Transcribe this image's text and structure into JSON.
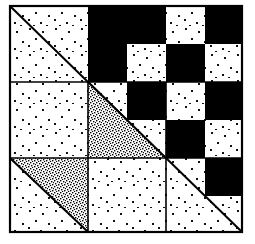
{
  "figure": {
    "canvas": {
      "width": 255,
      "height": 244
    },
    "frame": {
      "x": 9,
      "y": 5,
      "width": 234,
      "height": 228,
      "stroke_color": "#000000",
      "stroke_width": 2
    },
    "grid": {
      "rows": 3,
      "cols": 3,
      "cell_width": 78,
      "cell_height": 76
    },
    "colors": {
      "background": "#ffffff",
      "ink": "#000000",
      "sparse_dot": "#111111",
      "dense_dot": "#000000",
      "solid_black": "#000000"
    },
    "fill_legend": [
      {
        "key": "sparse",
        "label": "sparse dotted"
      },
      {
        "key": "dense",
        "label": "dense stippled"
      },
      {
        "key": "black",
        "label": "solid black"
      },
      {
        "key": "white",
        "label": "plain white"
      }
    ],
    "blocks": [
      {
        "id": "block-r1c1",
        "row": 1,
        "col": 1,
        "name": "top-left-diagonal-block",
        "background": "sparse",
        "diagonal": "tl-br",
        "quadrants": [
          "sparse",
          "black",
          "sparse",
          "sparse"
        ]
      },
      {
        "id": "block-r1c2",
        "row": 1,
        "col": 2,
        "name": "top-middle-checker-block",
        "background": "sparse",
        "diagonal": "none",
        "quadrants": [
          "sparse",
          "black",
          "black",
          "sparse"
        ]
      },
      {
        "id": "block-r1c3",
        "row": 1,
        "col": 3,
        "name": "top-right-checker-block",
        "background": "sparse",
        "diagonal": "none",
        "quadrants": [
          "sparse",
          "black",
          "black",
          "sparse"
        ]
      },
      {
        "id": "block-r2c1",
        "row": 2,
        "col": 1,
        "name": "middle-left-plain-block",
        "background": "sparse",
        "diagonal": "none",
        "quadrants": [
          "sparse",
          "sparse",
          "sparse",
          "sparse"
        ]
      },
      {
        "id": "block-r2c2",
        "row": 2,
        "col": 2,
        "name": "center-stippled-triangle-block",
        "background": "sparse",
        "diagonal": "tl-br",
        "triangle": "lower-left-dense",
        "quadrants": [
          "sparse",
          "black",
          "sparse",
          "sparse"
        ]
      },
      {
        "id": "block-r2c3",
        "row": 2,
        "col": 3,
        "name": "middle-right-checker-block",
        "background": "sparse",
        "diagonal": "none",
        "quadrants": [
          "sparse",
          "black",
          "black",
          "sparse"
        ]
      },
      {
        "id": "block-r3c1",
        "row": 3,
        "col": 1,
        "name": "bottom-left-stippled-triangle-block",
        "background": "sparse",
        "diagonal": "tl-br",
        "triangle": "upper-right-dense",
        "quadrants": [
          "sparse",
          "sparse",
          "sparse",
          "sparse"
        ]
      },
      {
        "id": "block-r3c2",
        "row": 3,
        "col": 2,
        "name": "bottom-middle-plain-block",
        "background": "sparse",
        "diagonal": "none",
        "quadrants": [
          "sparse",
          "sparse",
          "sparse",
          "sparse"
        ]
      },
      {
        "id": "block-r3c3",
        "row": 3,
        "col": 3,
        "name": "bottom-right-diagonal-block",
        "background": "sparse",
        "diagonal": "tl-br",
        "quadrants": [
          "sparse",
          "black",
          "sparse",
          "sparse"
        ]
      }
    ]
  }
}
